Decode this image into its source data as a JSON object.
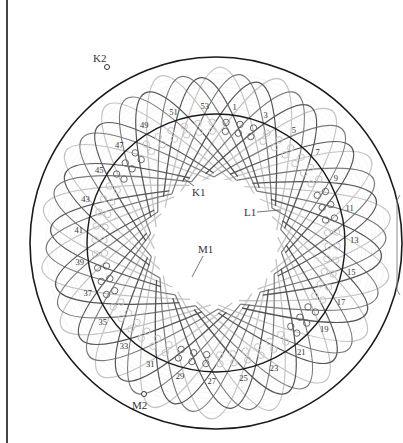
{
  "diagram": {
    "type": "stator-winding-diagram",
    "colors": {
      "outer_ring": "#1a1a1a",
      "coil_dark": "#555555",
      "coil_mid": "#7a7a7a",
      "coil_light": "#c4c4c4",
      "label": "#333333",
      "slot": "#666666"
    },
    "terminal_labels": {
      "K1": "K1",
      "K2": "K2",
      "L1": "L1",
      "M1": "M1",
      "M2": "M2"
    },
    "slot_numbers": [
      "1",
      "3",
      "5",
      "7",
      "9",
      "11",
      "13",
      "15",
      "17",
      "19",
      "21",
      "23",
      "25",
      "27",
      "29",
      "31",
      "33",
      "35",
      "37",
      "39",
      "41",
      "43",
      "45",
      "47",
      "49",
      "51",
      "53"
    ],
    "total_slots": 54
  }
}
